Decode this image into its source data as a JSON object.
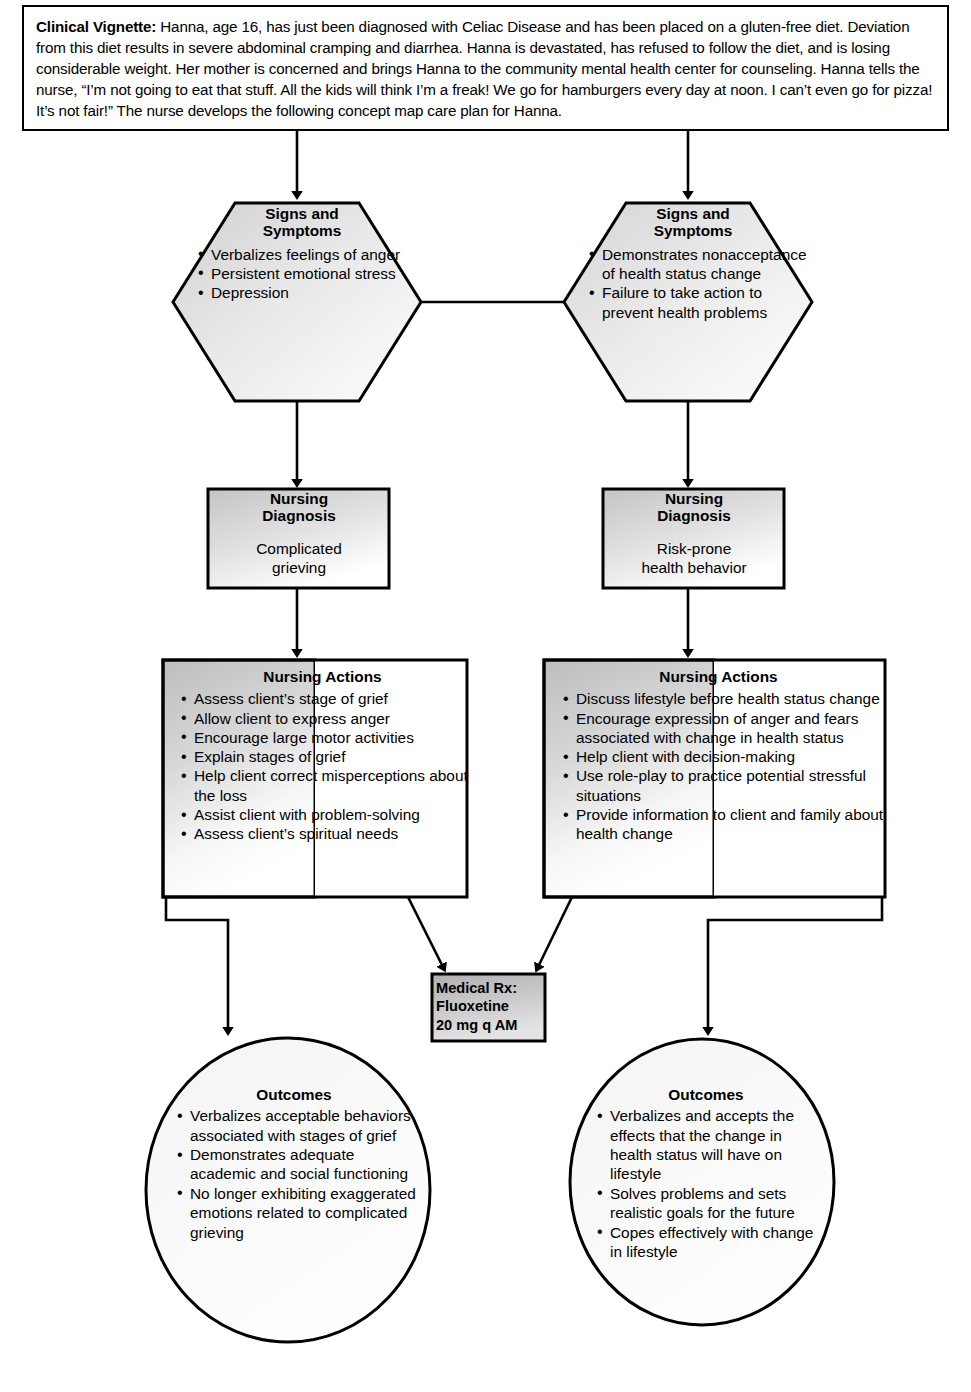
{
  "vignette": {
    "label": "Clinical Vignette:",
    "body": " Hanna, age 16, has just been diagnosed with Celiac Disease and has been placed on a gluten-free diet. Deviation from this diet results in severe abdominal cramping and diarrhea. Hanna is devastated, has refused to follow the diet, and is losing considerable weight. Her mother is concerned and brings Hanna to the community mental health center for counseling. Hanna tells the nurse, “I’m not going to eat that stuff. All the kids will think I’m a freak! We go for hamburgers every day at noon. I can’t even go for pizza! It’s not fair!” The nurse develops the following concept map care plan for Hanna."
  },
  "signs_left": {
    "title_line1": "Signs and",
    "title_line2": "Symptoms",
    "items": [
      "Verbalizes feelings of anger",
      "Persistent emotional stress",
      "Depression"
    ]
  },
  "signs_right": {
    "title_line1": "Signs and",
    "title_line2": "Symptoms",
    "items": [
      "Demonstrates nonacceptance of health status change",
      "Failure to take action to prevent health problems"
    ]
  },
  "diagnosis_left": {
    "title_line1": "Nursing",
    "title_line2": "Diagnosis",
    "body_line1": "Complicated",
    "body_line2": "grieving"
  },
  "diagnosis_right": {
    "title_line1": "Nursing",
    "title_line2": "Diagnosis",
    "body_line1": "Risk-prone",
    "body_line2": "health behavior"
  },
  "actions_left": {
    "title": "Nursing Actions",
    "items": [
      "Assess client’s stage of grief",
      "Allow client to express anger",
      "Encourage large motor activities",
      "Explain stages of grief",
      "Help client correct misperceptions about the loss",
      "Assist client with problem-solving",
      "Assess client’s spiritual needs"
    ]
  },
  "actions_right": {
    "title": "Nursing Actions",
    "items": [
      "Discuss lifestyle before health status change",
      "Encourage expression of anger and fears associated with change in health status",
      "Help client with decision-making",
      "Use role-play to practice potential stressful situations",
      "Provide information to client and family about health change"
    ]
  },
  "medical_rx": {
    "line1": "Medical Rx:",
    "line2": "Fluoxetine",
    "line3": "20 mg q AM"
  },
  "outcomes_left": {
    "title": "Outcomes",
    "items": [
      "Verbalizes acceptable behaviors associated with stages of grief",
      "Demonstrates adequate academic and social functioning",
      "No longer exhibiting exaggerated emotions related to complicated grieving"
    ]
  },
  "outcomes_right": {
    "title": "Outcomes",
    "items": [
      "Verbalizes and accepts the effects that the change in health status will have on lifestyle",
      "Solves problems and sets realistic goals for the future",
      "Copes effectively with change in lifestyle"
    ]
  },
  "colors": {
    "stroke": "#000000",
    "page_background": "#ffffff",
    "shape_fill_light": "#f2f2f2",
    "shape_fill_gray": "#c9c9c9",
    "rx_fill": "#bfbfbf"
  }
}
